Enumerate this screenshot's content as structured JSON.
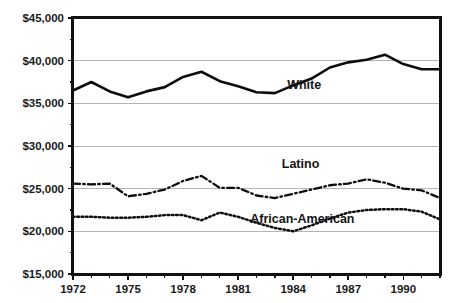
{
  "chart_data": {
    "type": "line",
    "title": "",
    "subtitle": "",
    "xlabel": "",
    "ylabel": "",
    "xlim": [
      1972,
      1992
    ],
    "ylim": [
      15000,
      45000
    ],
    "grid": true,
    "legend_position": "inline-annotation",
    "y_ticks": [
      15000,
      20000,
      25000,
      30000,
      35000,
      40000,
      45000
    ],
    "y_tick_labels": [
      "$15,000",
      "$20,000",
      "$25,000",
      "$30,000",
      "$35,000",
      "$40,000",
      "$45,000"
    ],
    "x_ticks": [
      1972,
      1973,
      1974,
      1975,
      1976,
      1977,
      1978,
      1979,
      1980,
      1981,
      1982,
      1983,
      1984,
      1985,
      1986,
      1987,
      1988,
      1989,
      1990,
      1991,
      1992
    ],
    "x_tick_labels_shown": [
      "1972",
      "1975",
      "1978",
      "1981",
      "1984",
      "1987",
      "1990"
    ],
    "x": [
      1972,
      1973,
      1974,
      1975,
      1976,
      1977,
      1978,
      1979,
      1980,
      1981,
      1982,
      1983,
      1984,
      1985,
      1986,
      1987,
      1988,
      1989,
      1990,
      1991,
      1992
    ],
    "series": [
      {
        "name": "White",
        "label": "White",
        "style": "solid",
        "color": "#0d0d0d",
        "values": [
          36500,
          37500,
          36400,
          35700,
          36400,
          36900,
          38100,
          38700,
          37600,
          37000,
          36300,
          36200,
          37100,
          37900,
          39200,
          39800,
          40100,
          40700,
          39600,
          39000,
          39000
        ]
      },
      {
        "name": "Latino",
        "label": "Latino",
        "style": "dash-dot",
        "color": "#0d0d0d",
        "values": [
          25600,
          25500,
          25600,
          24100,
          24400,
          24900,
          25900,
          26500,
          25100,
          25100,
          24200,
          23900,
          24400,
          24900,
          25400,
          25600,
          26100,
          25700,
          25000,
          24800,
          23900
        ]
      },
      {
        "name": "African-American",
        "label": "African-American",
        "style": "dotted",
        "color": "#0d0d0d",
        "values": [
          21700,
          21700,
          21600,
          21600,
          21700,
          21900,
          21900,
          21300,
          22200,
          21700,
          21000,
          20400,
          20000,
          20700,
          21500,
          22200,
          22500,
          22600,
          22600,
          22300,
          21400
        ]
      }
    ],
    "annotations": [
      {
        "text": "White",
        "x": 1984.6,
        "y": 36650
      },
      {
        "text": "Latino",
        "x": 1984.4,
        "y": 27450
      },
      {
        "text": "African-American",
        "x": 1984.5,
        "y": 20950
      }
    ]
  }
}
